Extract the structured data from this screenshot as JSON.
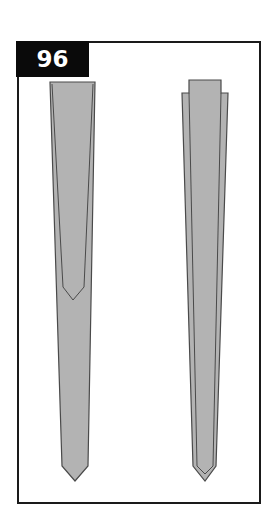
{
  "figure": {
    "number": "96",
    "colors": {
      "label_bg": "#0a0a0a",
      "label_text": "#ffffff",
      "frame": "#1a1a1a",
      "shape_fill": "#b3b3b3",
      "shape_stroke": "#4a4a4a"
    },
    "shapes": [
      {
        "name": "left-tapered-shape",
        "description": "tapered pointed bar with inner V outline"
      },
      {
        "name": "right-tapered-shape",
        "description": "tapered pointed bar with nested stepped outline"
      }
    ]
  }
}
